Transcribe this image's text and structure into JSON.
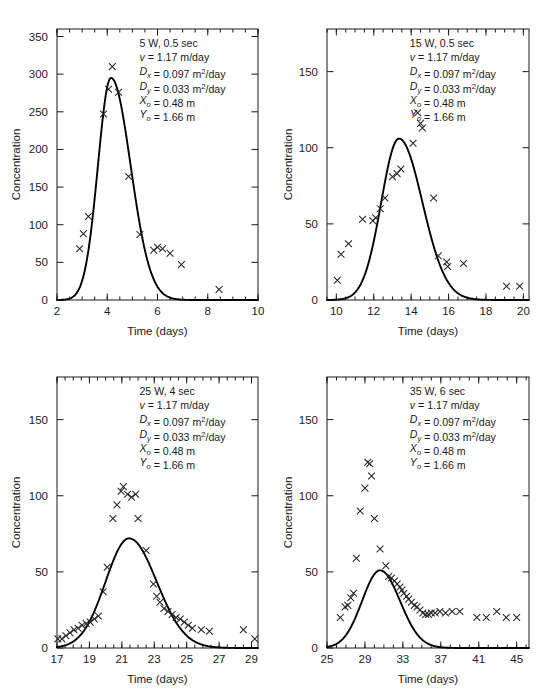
{
  "figure": {
    "panel_count": 4,
    "marker_symbol": "x-cross",
    "background_color": "#ffffff",
    "curve_color": "#000000",
    "marker_color": "#262626"
  },
  "chart_data": [
    {
      "type": "scatter",
      "id": "panel-a",
      "title": "",
      "xlabel": "Time (days)",
      "ylabel": "Concentration",
      "xlim": [
        2,
        10
      ],
      "ylim": [
        0,
        360
      ],
      "xticks": [
        2,
        4,
        6,
        8,
        10
      ],
      "xticklabels": [
        "2",
        "4",
        "6",
        "8",
        "10"
      ],
      "xminor_step": 0.5,
      "yticks": [
        0,
        50,
        100,
        150,
        200,
        250,
        300,
        350
      ],
      "yticklabels": [
        "0",
        "50",
        "100",
        "150",
        "200",
        "250",
        "300",
        "350"
      ],
      "grid": false,
      "legend_position": "none",
      "annotation": {
        "header": "5 W, 0.5 sec",
        "lines": [
          {
            "sym": "v",
            "sym_style": "italic",
            "sub": "",
            "text": " = 1.17 m/day"
          },
          {
            "sym": "D",
            "sym_style": "italic",
            "sub": "x",
            "text": " = 0.097 m",
            "sup": "2",
            "tail": "/day"
          },
          {
            "sym": "D",
            "sym_style": "italic",
            "sub": "y",
            "text": " = 0.033 m",
            "sup": "2",
            "tail": "/day"
          },
          {
            "sym": "X",
            "sym_style": "italic",
            "sub": "o",
            "text": " = 0.48 m"
          },
          {
            "sym": "Y",
            "sym_style": "italic",
            "sub": "o",
            "text": " = 1.66 m"
          }
        ]
      },
      "series": [
        {
          "name": "observed",
          "kind": "markers",
          "x": [
            2.9,
            3.05,
            3.25,
            3.85,
            4.05,
            4.2,
            4.45,
            4.85,
            5.3,
            5.85,
            6.0,
            6.2,
            6.5,
            6.95,
            8.45
          ],
          "y": [
            68,
            88,
            111,
            247,
            280,
            310,
            276,
            164,
            87,
            66,
            70,
            68,
            62,
            47,
            14
          ]
        },
        {
          "name": "model-fit",
          "kind": "curve",
          "peak_x": 4.15,
          "peak_y": 295,
          "sigma_left": 0.52,
          "sigma_right": 0.78
        }
      ]
    },
    {
      "type": "scatter",
      "id": "panel-b",
      "title": "",
      "xlabel": "Time (days)",
      "ylabel": "Concentration",
      "xlim": [
        9.5,
        20.3
      ],
      "ylim": [
        0,
        178
      ],
      "xticks": [
        10,
        12,
        14,
        16,
        18,
        20
      ],
      "xticklabels": [
        "10",
        "12",
        "14",
        "16",
        "18",
        "20"
      ],
      "xminor_step": 0.5,
      "yticks": [
        0,
        50,
        100,
        150
      ],
      "yticklabels": [
        "0",
        "50",
        "100",
        "150"
      ],
      "grid": false,
      "legend_position": "none",
      "annotation": {
        "header": "15 W, 0.5 sec",
        "lines": [
          {
            "sym": "v",
            "sym_style": "italic",
            "sub": "",
            "text": " = 1.17 m/day"
          },
          {
            "sym": "D",
            "sym_style": "italic",
            "sub": "x",
            "text": " = 0.097 m",
            "sup": "2",
            "tail": "/day"
          },
          {
            "sym": "D",
            "sym_style": "italic",
            "sub": "y",
            "text": " = 0.033 m",
            "sup": "2",
            "tail": "/day"
          },
          {
            "sym": "X",
            "sym_style": "italic",
            "sub": "o",
            "text": " = 0.48 m"
          },
          {
            "sym": "Y",
            "sym_style": "italic",
            "sub": "o",
            "text": " = 1.66 m"
          }
        ]
      },
      "series": [
        {
          "name": "observed",
          "kind": "markers",
          "x": [
            10.05,
            10.25,
            10.65,
            11.4,
            11.95,
            12.1,
            12.35,
            12.6,
            13.0,
            13.25,
            13.45,
            14.1,
            14.35,
            14.5,
            14.6,
            15.2,
            15.45,
            15.9,
            15.95,
            16.8,
            19.1,
            19.8
          ],
          "y": [
            13,
            30,
            37,
            53,
            52,
            54,
            60,
            67,
            81,
            83,
            86,
            103,
            123,
            116,
            113,
            67,
            29,
            25,
            22,
            24,
            9,
            9
          ]
        },
        {
          "name": "model-fit",
          "kind": "curve",
          "peak_x": 13.35,
          "peak_y": 106,
          "sigma_left": 0.95,
          "sigma_right": 1.25
        }
      ]
    },
    {
      "type": "scatter",
      "id": "panel-c",
      "title": "",
      "xlabel": "Time (days)",
      "ylabel": "Concentration",
      "xlim": [
        17,
        29.4
      ],
      "ylim": [
        0,
        178
      ],
      "xticks": [
        17,
        19,
        21,
        23,
        25,
        27,
        29
      ],
      "xticklabels": [
        "17",
        "19",
        "21",
        "23",
        "25",
        "27",
        "29"
      ],
      "xminor_step": 0.5,
      "yticks": [
        0,
        50,
        100,
        150
      ],
      "yticklabels": [
        "0",
        "50",
        "100",
        "150"
      ],
      "grid": false,
      "legend_position": "none",
      "annotation": {
        "header": "25 W, 4 sec",
        "lines": [
          {
            "sym": "v",
            "sym_style": "italic",
            "sub": "",
            "text": " = 1.17 m/day"
          },
          {
            "sym": "D",
            "sym_style": "italic",
            "sub": "x",
            "text": " = 0.097 m",
            "sup": "2",
            "tail": "/day"
          },
          {
            "sym": "D",
            "sym_style": "italic",
            "sub": "y",
            "text": " = 0.033 m",
            "sup": "2",
            "tail": "/day"
          },
          {
            "sym": "X",
            "sym_style": "italic",
            "sub": "o",
            "text": " = 0.48 m"
          },
          {
            "sym": "Y",
            "sym_style": "italic",
            "sub": "o",
            "text": " = 1.66 m"
          }
        ]
      },
      "series": [
        {
          "name": "observed",
          "kind": "markers",
          "x": [
            17.05,
            17.3,
            17.55,
            17.8,
            18.05,
            18.3,
            18.55,
            18.8,
            19.05,
            19.3,
            19.55,
            19.85,
            20.1,
            20.45,
            20.7,
            20.95,
            21.1,
            21.35,
            21.6,
            21.85,
            22.0,
            22.5,
            22.95,
            23.15,
            23.35,
            23.6,
            23.85,
            24.1,
            24.35,
            24.6,
            24.85,
            25.1,
            25.35,
            25.9,
            26.4,
            28.5,
            29.2
          ],
          "y": [
            6,
            6,
            8,
            10,
            12,
            13,
            15,
            16,
            17,
            19,
            21,
            37,
            53,
            85,
            94,
            103,
            106,
            101,
            99,
            101,
            85,
            64,
            42,
            34,
            30,
            26,
            24,
            22,
            20,
            19,
            17,
            15,
            13,
            12,
            11,
            12,
            6
          ]
        },
        {
          "name": "model-fit",
          "kind": "curve",
          "peak_x": 21.45,
          "peak_y": 72,
          "sigma_left": 1.45,
          "sigma_right": 1.7
        }
      ]
    },
    {
      "type": "scatter",
      "id": "panel-d",
      "title": "",
      "xlabel": "Time (days)",
      "ylabel": "Concentration",
      "xlim": [
        25,
        46.3
      ],
      "ylim": [
        0,
        178
      ],
      "xticks": [
        25,
        29,
        33,
        37,
        41,
        45
      ],
      "xticklabels": [
        "25",
        "29",
        "33",
        "37",
        "41",
        "45"
      ],
      "xminor_step": 1,
      "yticks": [
        0,
        50,
        100,
        150
      ],
      "yticklabels": [
        "0",
        "50",
        "100",
        "150"
      ],
      "grid": false,
      "legend_position": "none",
      "annotation": {
        "header": "35 W, 6 sec",
        "lines": [
          {
            "sym": "v",
            "sym_style": "italic",
            "sub": "",
            "text": " = 1.17 m/day"
          },
          {
            "sym": "D",
            "sym_style": "italic",
            "sub": "x",
            "text": " = 0.097 m",
            "sup": "2",
            "tail": "/day"
          },
          {
            "sym": "D",
            "sym_style": "italic",
            "sub": "y",
            "text": " = 0.033 m",
            "sup": "2",
            "tail": "/day"
          },
          {
            "sym": "X",
            "sym_style": "italic",
            "sub": "o",
            "text": " = 0.48 m"
          },
          {
            "sym": "Y",
            "sym_style": "italic",
            "sub": "o",
            "text": " = 1.66 m"
          }
        ]
      },
      "series": [
        {
          "name": "observed",
          "kind": "markers",
          "x": [
            26.4,
            26.9,
            27.2,
            27.5,
            27.8,
            28.1,
            28.5,
            29.0,
            29.3,
            29.5,
            29.7,
            30.0,
            30.6,
            31.2,
            31.5,
            31.8,
            32.1,
            32.4,
            32.7,
            32.9,
            33.1,
            33.4,
            33.6,
            33.9,
            34.2,
            34.5,
            34.8,
            35.1,
            35.4,
            35.7,
            36.0,
            36.4,
            36.9,
            37.5,
            38.2,
            39.0,
            40.8,
            41.8,
            42.9,
            43.9,
            45.0
          ],
          "y": [
            20,
            27,
            28,
            33,
            36,
            59,
            90,
            105,
            122,
            121,
            113,
            85,
            65,
            54,
            47,
            46,
            44,
            42,
            40,
            38,
            36,
            34,
            32,
            30,
            28,
            27,
            25,
            23,
            22,
            22,
            23,
            23,
            24,
            23,
            24,
            24,
            20,
            20,
            24,
            20,
            20
          ]
        },
        {
          "name": "model-fit",
          "kind": "curve",
          "peak_x": 30.6,
          "peak_y": 51,
          "sigma_left": 1.9,
          "sigma_right": 2.1
        }
      ]
    }
  ]
}
